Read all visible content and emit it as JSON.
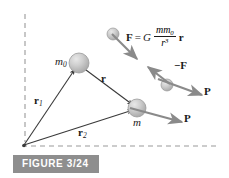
{
  "figure": {
    "caption": "FIGURE 3/24",
    "caption_box_color": "#8e8e8e",
    "caption_text_color": "#ffffff",
    "background_color": "#ffffff",
    "ink_color": "#1a1a1a",
    "vector_color": "#7a7a7a",
    "sphere_color": "#c8c8c8"
  },
  "labels": {
    "m0": "m",
    "m0_sub": "0",
    "m": "m",
    "r1": "r",
    "r1_sub": "1",
    "r2": "r",
    "r2_sub": "2",
    "r": "r",
    "neg_force": "−F",
    "momentum_upper": "P",
    "momentum_lower": "P"
  },
  "formula": {
    "lhs": "F",
    "equals": "=",
    "constant": "G",
    "numerator": "mm",
    "numerator_sub": "0",
    "denominator": "r",
    "denominator_sup": "3",
    "trailing_vector": "r"
  },
  "elements": {
    "vertical_dashed_axis": "vertical-dashed-axis",
    "horizontal_dashed_axis": "horizontal-dashed-axis",
    "origin": "origin-point",
    "sphere_m0": "sphere-m0",
    "sphere_m": "sphere-m",
    "sphere_force_upper": "sphere-upper-right",
    "sphere_force_lower": "sphere-lower-right",
    "vector_r1": "vector-r1",
    "vector_r2": "vector-r2",
    "vector_r": "vector-r",
    "vector_F": "vector-force",
    "vector_negF": "vector-neg-force",
    "vector_P_upper": "vector-momentum-upper",
    "vector_P_lower": "vector-momentum-lower"
  }
}
